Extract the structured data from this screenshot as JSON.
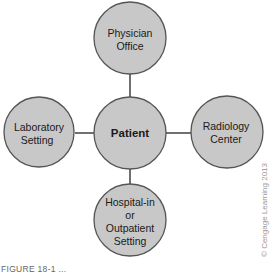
{
  "diagram": {
    "center": {
      "label": "Patient"
    },
    "top": {
      "line1": "Physician",
      "line2": "Office"
    },
    "left": {
      "line1": "Laboratory",
      "line2": "Setting"
    },
    "right": {
      "line1": "Radiology",
      "line2": "Center"
    },
    "bottom": {
      "line1": "Hospital-in",
      "line2": "or",
      "line3": "Outpatient",
      "line4": "Setting"
    },
    "colors": {
      "node_fill": "#c8c8c8",
      "node_stroke": "#555555",
      "edge": "#333333"
    }
  },
  "copyright": "© Cengage Learning 2013",
  "caption": "FIGURE 18-1 ..."
}
